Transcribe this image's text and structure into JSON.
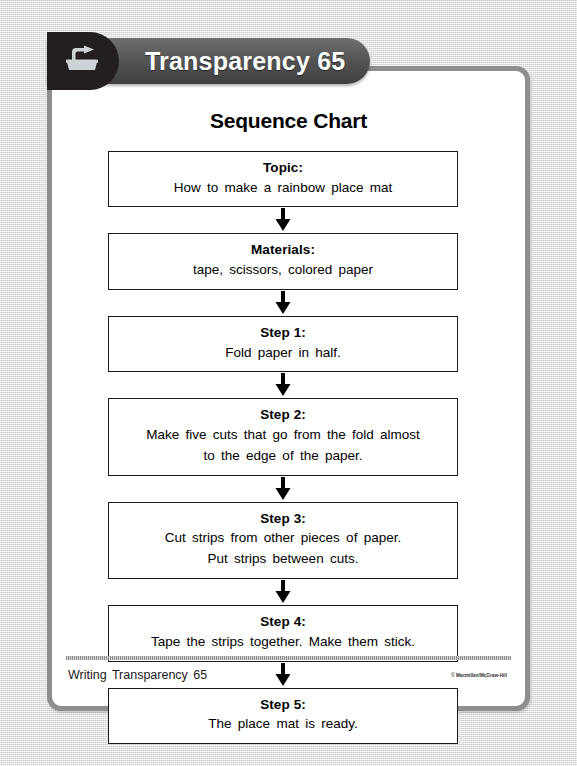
{
  "header": {
    "title": "Transparency 65",
    "icon": "overhead-projector-icon"
  },
  "sheet": {
    "chart_title": "Sequence Chart"
  },
  "flow": {
    "arrow_icon": "down-arrow-icon",
    "nodes": [
      {
        "heading": "Topic:",
        "lines": [
          "How to make a rainbow place mat"
        ]
      },
      {
        "heading": "Materials:",
        "lines": [
          "tape, scissors, colored paper"
        ]
      },
      {
        "heading": "Step 1:",
        "lines": [
          "Fold paper in half."
        ]
      },
      {
        "heading": "Step 2:",
        "lines": [
          "Make five cuts that go from the fold almost",
          "to the edge of the paper."
        ]
      },
      {
        "heading": "Step 3:",
        "lines": [
          "Cut strips from other pieces of paper.",
          "Put strips between cuts."
        ]
      },
      {
        "heading": "Step 4:",
        "lines": [
          "Tape the strips together. Make them stick."
        ]
      },
      {
        "heading": "Step 5:",
        "lines": [
          "The place mat is ready."
        ]
      }
    ]
  },
  "footer": {
    "label": "Writing Transparency 65",
    "copyright": "© Macmillan/McGraw-Hill"
  },
  "colors": {
    "banner_dark": "#3f3f3f",
    "badge_black": "#231f20",
    "sheet_border": "#8e8e8e",
    "backdrop": "#e9e9e7",
    "box_border": "#1a1a1a"
  }
}
